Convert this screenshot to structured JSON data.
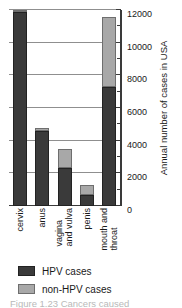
{
  "chart_data": {
    "type": "bar",
    "subtype": "stacked-bar",
    "title": "",
    "xlabel": "",
    "ylabel": "Annual number of cases in USA",
    "ylim": [
      0,
      12000
    ],
    "ytick_step": 2000,
    "yticks": [
      0,
      2000,
      4000,
      6000,
      8000,
      10000,
      12000
    ],
    "ytick_labels": [
      "0",
      "2000",
      "4000",
      "6000",
      "8000",
      "10000",
      "12000"
    ],
    "minor_tick_step": 1000,
    "grid": true,
    "grid_axis": "y",
    "axis_position": "right",
    "legend_position": "bottom-left",
    "categories": [
      "cervix",
      "anus",
      "vagina and vulva",
      "penis",
      "mouth and throat"
    ],
    "category_lines": [
      [
        "cervix"
      ],
      [
        "anus"
      ],
      [
        "vagina",
        "and vulva"
      ],
      [
        "penis"
      ],
      [
        "mouth and",
        "throat"
      ]
    ],
    "series": [
      {
        "name": "HPV cases",
        "color": "#3a3a3a",
        "values": [
          11900,
          4600,
          2300,
          700,
          7300
        ]
      },
      {
        "name": "non-HPV cases",
        "color": "#a8a8a8",
        "values": [
          100,
          200,
          1200,
          600,
          4300
        ]
      }
    ],
    "totals": [
      12000,
      4800,
      3500,
      1300,
      11600
    ]
  },
  "legend": {
    "entries": [
      {
        "label": "HPV cases",
        "color": "#3a3a3a"
      },
      {
        "label": "non-HPV cases",
        "color": "#a8a8a8"
      }
    ]
  },
  "caption": {
    "text": "Figure 1.23 Cancers caused"
  },
  "colors": {
    "hpv": "#3a3a3a",
    "non_hpv": "#a8a8a8",
    "axis": "#3a3a3a",
    "gridline": "#8f8f8f",
    "background": "#ffffff"
  }
}
